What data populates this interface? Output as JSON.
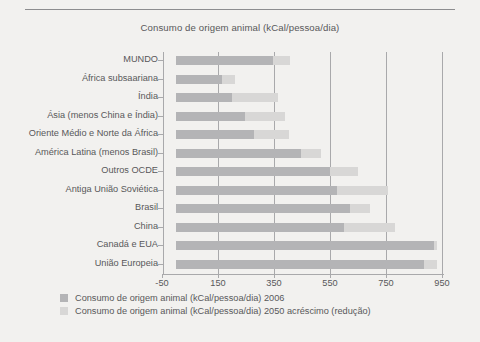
{
  "figure": {
    "background_color": "#f2f1ef",
    "rule_color": "#8d8d8f",
    "text_color": "#58585a"
  },
  "chart_data": {
    "type": "bar",
    "orientation": "horizontal",
    "stacked": true,
    "title": "Consumo de origem animal (kCal/pessoa/dia)",
    "xlabel": "",
    "ylabel": "",
    "xlim": [
      -50,
      950
    ],
    "xticks": [
      -50,
      150,
      350,
      550,
      750,
      950
    ],
    "xtick_labels": [
      "-50",
      "150",
      "350",
      "550",
      "750",
      "950"
    ],
    "grid": true,
    "grid_axis": "x",
    "legend_position": "below",
    "categories": [
      "MUNDO",
      "África subsaariana",
      "Índia",
      "Ásia (menos China e Índia)",
      "Oriente Médio e Norte da África",
      "América Latina (menos Brasil)",
      "Outros OCDE",
      "Antiga União Soviética",
      "Brasil",
      "China",
      "Canadá e EUA",
      "União Europeia"
    ],
    "series": [
      {
        "name": "Consumo de origem animal (kCal/pessoa/dia) 2006",
        "color": "#b4b4b6",
        "values": [
          346,
          164,
          200,
          246,
          279,
          446,
          550,
          575,
          621,
          600,
          921,
          886
        ]
      },
      {
        "name": "Consumo de origem animal (kCal/pessoa/dia) 2050 acréscimo (redução)",
        "color": "#d8d7d6",
        "values": [
          61,
          46,
          164,
          143,
          125,
          72,
          100,
          182,
          72,
          182,
          11,
          46
        ]
      }
    ],
    "totals_2050": [
      407,
      210,
      364,
      389,
      404,
      518,
      650,
      757,
      693,
      782,
      932,
      932
    ]
  },
  "legend": {
    "items": [
      {
        "label": "Consumo de origem animal (kCal/pessoa/dia) 2006",
        "color": "#b4b4b6"
      },
      {
        "label": "Consumo de origem animal (kCal/pessoa/dia) 2050 acréscimo (redução)",
        "color": "#d8d7d6"
      }
    ]
  }
}
